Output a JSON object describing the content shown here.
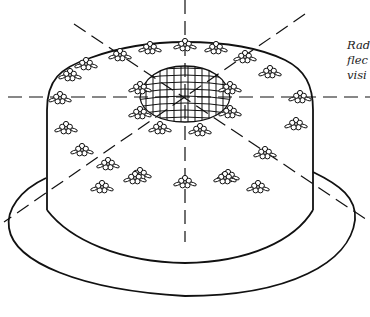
{
  "figure": {
    "colors": {
      "ink": "#111111",
      "background": "#ffffff"
    },
    "caption_lines": [
      "Rad",
      "flec",
      "visi"
    ],
    "elements": {
      "cake_body": "cylindrical cake",
      "plate": "oval plate / brim",
      "top_grid": "lattice dome at center of top",
      "flower_wreaths": [
        "outer top border wreath",
        "inner top wreath",
        "side garland wreath"
      ],
      "reference_lines": [
        "horizontal dashed",
        "vertical dashed",
        "diagonal dashed 1",
        "diagonal dashed 2"
      ]
    }
  }
}
